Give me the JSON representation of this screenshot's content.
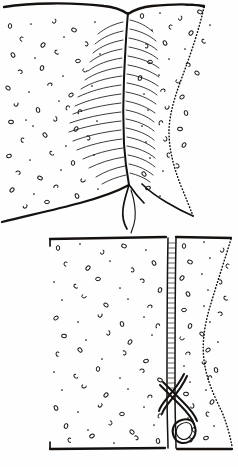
{
  "figure": {
    "style": "ink-line-drawing",
    "ink_color": "#14110f",
    "paper_color": "#fefefe",
    "width": 238,
    "height": 467,
    "panels": [
      {
        "id": "upper-panel",
        "name": "upper-specimen-view",
        "description": "Broad plate with median suture and lateral bristle rows",
        "bounds": {
          "x": 0,
          "y": 0,
          "w": 238,
          "h": 228
        },
        "features": [
          "top-margin-curve",
          "median-suture",
          "bristle-rows",
          "stipple-field",
          "dotted-right-margin",
          "bottom-margin-curve",
          "terminal-fork"
        ]
      },
      {
        "id": "lower-panel",
        "name": "lower-specimen-view",
        "description": "Rectangular plate with striated median band and hooked clasper",
        "bounds": {
          "x": 45,
          "y": 234,
          "w": 193,
          "h": 215
        },
        "features": [
          "top-border",
          "bottom-border",
          "striated-median-band",
          "stipple-field",
          "dotted-right-margin",
          "hooked-clasper"
        ]
      }
    ],
    "labels": [],
    "caption": ""
  },
  "chart_data": {
    "type": "scatter",
    "xlabel": "",
    "ylabel": "",
    "xlim": [
      0,
      238
    ],
    "ylim": [
      0,
      467
    ],
    "grid": false,
    "legend": "none",
    "series": [
      {
        "name": "upper-left-stipple",
        "marker": "ring",
        "points": [
          [
            10,
            26
          ],
          [
            31,
            24
          ],
          [
            54,
            21
          ],
          [
            74,
            30
          ],
          [
            95,
            22
          ],
          [
            22,
            39
          ],
          [
            43,
            45
          ],
          [
            64,
            37
          ],
          [
            86,
            44
          ],
          [
            13,
            55
          ],
          [
            35,
            58
          ],
          [
            57,
            52
          ],
          [
            78,
            61
          ],
          [
            100,
            54
          ],
          [
            20,
            72
          ],
          [
            42,
            68
          ],
          [
            63,
            76
          ],
          [
            85,
            70
          ],
          [
            8,
            88
          ],
          [
            29,
            92
          ],
          [
            50,
            85
          ],
          [
            71,
            95
          ],
          [
            92,
            86
          ],
          [
            16,
            104
          ],
          [
            38,
            110
          ],
          [
            59,
            101
          ],
          [
            80,
            112
          ],
          [
            11,
            122
          ],
          [
            33,
            126
          ],
          [
            55,
            119
          ],
          [
            76,
            129
          ],
          [
            97,
            121
          ],
          [
            23,
            140
          ],
          [
            45,
            135
          ],
          [
            66,
            146
          ],
          [
            88,
            138
          ],
          [
            9,
            156
          ],
          [
            30,
            160
          ],
          [
            52,
            153
          ],
          [
            73,
            163
          ],
          [
            94,
            155
          ],
          [
            18,
            173
          ],
          [
            40,
            178
          ],
          [
            61,
            170
          ],
          [
            83,
            180
          ],
          [
            12,
            190
          ],
          [
            34,
            194
          ],
          [
            56,
            187
          ],
          [
            77,
            196
          ],
          [
            98,
            189
          ],
          [
            25,
            206
          ],
          [
            47,
            202
          ],
          [
            26,
            120
          ],
          [
            68,
            108
          ]
        ]
      },
      {
        "name": "upper-right-stipple",
        "marker": "ring",
        "points": [
          [
            142,
            16
          ],
          [
            160,
            13
          ],
          [
            180,
            18
          ],
          [
            200,
            12
          ],
          [
            152,
            30
          ],
          [
            171,
            27
          ],
          [
            191,
            33
          ],
          [
            210,
            25
          ],
          [
            146,
            46
          ],
          [
            165,
            43
          ],
          [
            185,
            49
          ],
          [
            204,
            41
          ],
          [
            150,
            62
          ],
          [
            169,
            59
          ],
          [
            188,
            65
          ],
          [
            140,
            78
          ],
          [
            159,
            75
          ],
          [
            178,
            81
          ],
          [
            197,
            73
          ],
          [
            144,
            94
          ],
          [
            163,
            91
          ],
          [
            182,
            97
          ],
          [
            148,
            110
          ],
          [
            167,
            107
          ],
          [
            186,
            113
          ],
          [
            142,
            126
          ],
          [
            161,
            123
          ],
          [
            180,
            129
          ],
          [
            146,
            142
          ],
          [
            165,
            139
          ],
          [
            184,
            145
          ],
          [
            150,
            158
          ],
          [
            169,
            155
          ],
          [
            144,
            174
          ],
          [
            163,
            171
          ],
          [
            177,
            166
          ],
          [
            148,
            188
          ],
          [
            160,
            196
          ]
        ]
      },
      {
        "name": "lower-left-stipple",
        "marker": "ring",
        "points": [
          [
            58,
            248
          ],
          [
            80,
            244
          ],
          [
            102,
            252
          ],
          [
            124,
            246
          ],
          [
            146,
            250
          ],
          [
            66,
            264
          ],
          [
            88,
            268
          ],
          [
            110,
            261
          ],
          [
            132,
            270
          ],
          [
            154,
            263
          ],
          [
            54,
            282
          ],
          [
            76,
            286
          ],
          [
            98,
            279
          ],
          [
            120,
            288
          ],
          [
            142,
            281
          ],
          [
            160,
            290
          ],
          [
            62,
            300
          ],
          [
            84,
            296
          ],
          [
            106,
            305
          ],
          [
            128,
            299
          ],
          [
            150,
            307
          ],
          [
            56,
            318
          ],
          [
            78,
            322
          ],
          [
            100,
            315
          ],
          [
            122,
            324
          ],
          [
            144,
            317
          ],
          [
            158,
            326
          ],
          [
            64,
            336
          ],
          [
            86,
            340
          ],
          [
            108,
            333
          ],
          [
            130,
            342
          ],
          [
            152,
            335
          ],
          [
            58,
            354
          ],
          [
            80,
            350
          ],
          [
            102,
            359
          ],
          [
            124,
            353
          ],
          [
            146,
            361
          ],
          [
            54,
            372
          ],
          [
            76,
            376
          ],
          [
            98,
            369
          ],
          [
            120,
            378
          ],
          [
            142,
            371
          ],
          [
            160,
            380
          ],
          [
            62,
            390
          ],
          [
            84,
            386
          ],
          [
            106,
            395
          ],
          [
            128,
            389
          ],
          [
            150,
            397
          ],
          [
            56,
            408
          ],
          [
            78,
            412
          ],
          [
            100,
            405
          ],
          [
            122,
            414
          ],
          [
            144,
            407
          ],
          [
            160,
            416
          ],
          [
            66,
            426
          ],
          [
            88,
            430
          ],
          [
            110,
            423
          ],
          [
            132,
            432
          ],
          [
            154,
            425
          ],
          [
            70,
            440
          ],
          [
            92,
            436
          ],
          [
            114,
            443
          ],
          [
            136,
            438
          ],
          [
            158,
            441
          ]
        ]
      },
      {
        "name": "lower-right-stipple",
        "marker": "ring",
        "points": [
          [
            184,
            246
          ],
          [
            204,
            242
          ],
          [
            222,
            250
          ],
          [
            190,
            262
          ],
          [
            210,
            258
          ],
          [
            228,
            266
          ],
          [
            182,
            278
          ],
          [
            202,
            274
          ],
          [
            220,
            282
          ],
          [
            188,
            294
          ],
          [
            208,
            290
          ],
          [
            226,
            298
          ],
          [
            184,
            310
          ],
          [
            204,
            306
          ],
          [
            220,
            314
          ],
          [
            190,
            326
          ],
          [
            210,
            322
          ],
          [
            182,
            338
          ],
          [
            202,
            334
          ],
          [
            218,
            342
          ],
          [
            188,
            354
          ],
          [
            208,
            350
          ],
          [
            184,
            366
          ],
          [
            204,
            362
          ],
          [
            216,
            370
          ],
          [
            190,
            382
          ],
          [
            210,
            378
          ],
          [
            186,
            394
          ],
          [
            206,
            390
          ],
          [
            192,
            406
          ],
          [
            212,
            402
          ],
          [
            188,
            418
          ],
          [
            208,
            414
          ],
          [
            194,
            430
          ],
          [
            214,
            426
          ],
          [
            190,
            440
          ],
          [
            206,
            438
          ]
        ]
      }
    ]
  }
}
